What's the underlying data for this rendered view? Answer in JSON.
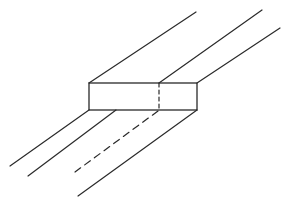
{
  "diagram": {
    "stroke_color": "#2a2a2a",
    "background": "#ffffff",
    "block": {
      "x": 89,
      "y": 83,
      "width": 108,
      "height": 27
    },
    "block_divider": {
      "x": 159,
      "y1": 83,
      "y2": 110,
      "style": "dashed"
    },
    "upper_lines": [
      {
        "x1": 89,
        "y1": 83,
        "x2": 196,
        "y2": 12,
        "style": "solid"
      },
      {
        "x1": 159,
        "y1": 83,
        "x2": 262,
        "y2": 10,
        "style": "solid"
      },
      {
        "x1": 197,
        "y1": 83,
        "x2": 280,
        "y2": 28,
        "style": "solid"
      }
    ],
    "lower_lines": [
      {
        "x1": 89,
        "y1": 110,
        "x2": 10,
        "y2": 166,
        "style": "solid"
      },
      {
        "x1": 116,
        "y1": 110,
        "x2": 28,
        "y2": 176,
        "style": "solid"
      },
      {
        "x1": 158,
        "y1": 111,
        "x2": 75,
        "y2": 172,
        "style": "dashed"
      },
      {
        "x1": 197,
        "y1": 110,
        "x2": 78,
        "y2": 196,
        "style": "solid"
      }
    ]
  }
}
